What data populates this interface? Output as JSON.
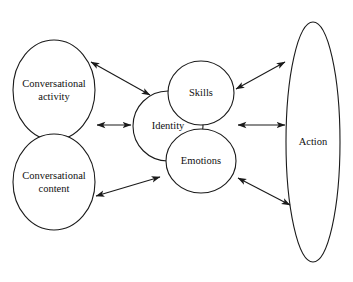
{
  "diagram": {
    "background_color": "#ffffff",
    "line_color": "#1a1a1a",
    "text_color": "#101010",
    "nodes": [
      {
        "id": "conversational-activity",
        "label": "Conversational\nactivity",
        "shape": "ellipse",
        "cx": 54,
        "cy": 90,
        "rx": 41,
        "ry": 50
      },
      {
        "id": "conversational-content",
        "label": "Conversational\ncontent",
        "shape": "ellipse",
        "cx": 54,
        "cy": 182,
        "rx": 41,
        "ry": 48
      },
      {
        "id": "identity",
        "label": "Identity",
        "shape": "circle",
        "cx": 168,
        "cy": 126,
        "rx": 35,
        "ry": 35
      },
      {
        "id": "skills",
        "label": "Skills",
        "shape": "circle",
        "cx": 201,
        "cy": 93,
        "rx": 33,
        "ry": 32
      },
      {
        "id": "emotions",
        "label": "Emotions",
        "shape": "circle",
        "cx": 201,
        "cy": 161,
        "rx": 35,
        "ry": 32
      },
      {
        "id": "action",
        "label": "Action",
        "shape": "ellipse",
        "cx": 313,
        "cy": 142,
        "rx": 27,
        "ry": 120
      }
    ],
    "connectors": [
      {
        "id": "activity-identity",
        "from": "conversational-activity",
        "to": "skills",
        "arrowheads": "both",
        "x1": 91,
        "y1": 62,
        "x2": 150,
        "y2": 95
      },
      {
        "id": "activity-content-identity",
        "from": "conversational-activity",
        "to": "identity",
        "arrowheads": "both",
        "x1": 97,
        "y1": 125,
        "x2": 131,
        "y2": 125
      },
      {
        "id": "content-emotions",
        "from": "conversational-content",
        "to": "emotions",
        "arrowheads": "both",
        "x1": 96,
        "y1": 196,
        "x2": 160,
        "y2": 177
      },
      {
        "id": "skills-action",
        "from": "skills",
        "to": "action",
        "arrowheads": "both",
        "x1": 236,
        "y1": 89,
        "x2": 285,
        "y2": 62
      },
      {
        "id": "identity-action",
        "from": "identity",
        "to": "action",
        "arrowheads": "both",
        "x1": 238,
        "y1": 125,
        "x2": 285,
        "y2": 125
      },
      {
        "id": "emotions-action",
        "from": "emotions",
        "to": "action",
        "arrowheads": "both",
        "x1": 238,
        "y1": 178,
        "x2": 290,
        "y2": 205
      }
    ]
  }
}
